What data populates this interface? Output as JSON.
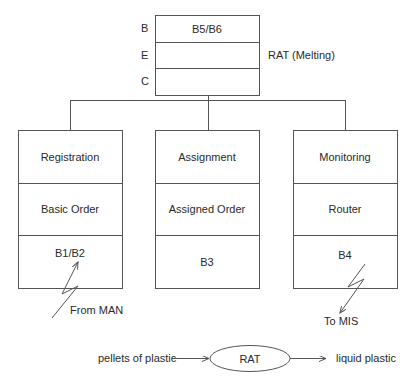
{
  "top_box": {
    "row_labels": [
      "B",
      "E",
      "C"
    ],
    "rows": [
      "B5/B6",
      "",
      ""
    ],
    "side_label": "RAT (Melting)"
  },
  "modules": [
    {
      "rows": [
        "Registration",
        "Basic Order",
        "B1/B2"
      ],
      "link_label": "From MAN",
      "link_direction": "in"
    },
    {
      "rows": [
        "Assignment",
        "Assigned Order",
        "B3"
      ]
    },
    {
      "rows": [
        "Monitoring",
        "Router",
        "B4"
      ],
      "link_label": "To MIS",
      "link_direction": "out"
    }
  ],
  "process": {
    "input": "pellets of plastic",
    "node": "RAT",
    "output": "liquid plastic"
  },
  "colors": {
    "line": "#555555",
    "text": "#2a2a2a"
  }
}
